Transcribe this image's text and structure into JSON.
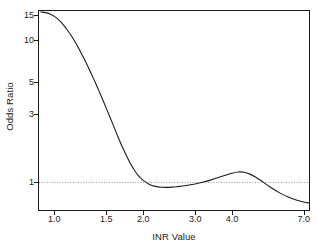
{
  "chart_data": {
    "type": "line",
    "title": "",
    "subtitle": "",
    "xlabel": "INR Value",
    "ylabel": "Odds Ratio",
    "xscale": "log",
    "yscale": "log",
    "xlim": [
      0.88,
      7.35
    ],
    "ylim": [
      0.62,
      16.2
    ],
    "xticks": [
      1.0,
      1.5,
      2.0,
      3.0,
      4.0,
      7.0
    ],
    "xticklabels": [
      "1.0",
      "1.5",
      "2.0",
      "3.0",
      "4.0",
      "7.0"
    ],
    "yticks": [
      1,
      3,
      5,
      10,
      15
    ],
    "yticklabels": [
      "1",
      "3",
      "5",
      "10",
      "15"
    ],
    "grid": false,
    "legend": null,
    "line_color": "#1a1a1a",
    "line_width": 1.1,
    "reference_line": {
      "orientation": "horizontal",
      "value": 1,
      "style": "dotted",
      "color": "#9a9a9a"
    },
    "series": [
      {
        "name": "Odds Ratio",
        "x": [
          0.9,
          0.95,
          1.0,
          1.05,
          1.1,
          1.15,
          1.2,
          1.25,
          1.3,
          1.35,
          1.4,
          1.45,
          1.5,
          1.55,
          1.6,
          1.65,
          1.7,
          1.75,
          1.8,
          1.85,
          1.9,
          1.95,
          2.0,
          2.1,
          2.2,
          2.3,
          2.4,
          2.5,
          2.6,
          2.8,
          3.0,
          3.2,
          3.4,
          3.6,
          3.8,
          4.0,
          4.2,
          4.4,
          4.6,
          4.8,
          5.0,
          5.4,
          5.8,
          6.2,
          6.6,
          7.0,
          7.3
        ],
        "y": [
          15.7,
          15.4,
          14.6,
          13.4,
          11.9,
          10.4,
          8.95,
          7.6,
          6.45,
          5.45,
          4.6,
          3.88,
          3.28,
          2.78,
          2.36,
          2.02,
          1.75,
          1.54,
          1.37,
          1.24,
          1.14,
          1.07,
          1.02,
          0.955,
          0.925,
          0.912,
          0.91,
          0.913,
          0.92,
          0.938,
          0.962,
          0.992,
          1.028,
          1.068,
          1.108,
          1.145,
          1.168,
          1.162,
          1.128,
          1.078,
          1.02,
          0.912,
          0.832,
          0.778,
          0.742,
          0.718,
          0.706
        ]
      }
    ]
  },
  "axes": {
    "x_title": "INR Value",
    "y_title": "Odds Ratio"
  }
}
